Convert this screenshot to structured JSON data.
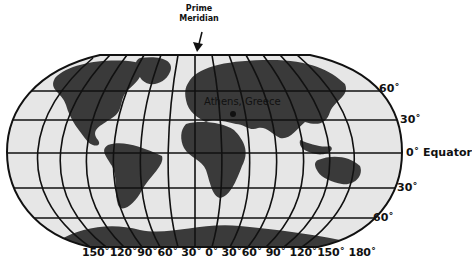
{
  "prime_meridian": {
    "line1": "Prime",
    "line2": "Meridian"
  },
  "city_label": "Athens, Greece",
  "latitude_labels": {
    "n60": "60˚",
    "n30": "30˚",
    "eq": "0˚ Equator",
    "s30": "30˚",
    "s60": "60˚"
  },
  "longitude_labels": "150˚120˚90˚60˚ 30˚  0˚ 30˚60˚ 90˚ 120˚150˚ 180˚",
  "colors": {
    "ocean": "#e6e6e6",
    "land": "#3a3a3a",
    "grid": "#111111"
  }
}
